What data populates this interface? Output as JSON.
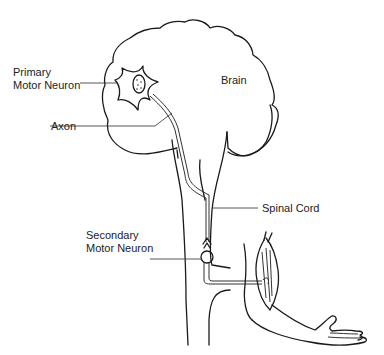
{
  "diagram": {
    "type": "anatomical-line-drawing",
    "labels": {
      "primary_motor_neuron_line1": "Primary",
      "primary_motor_neuron_line2": "Motor Neuron",
      "axon": "Axon",
      "brain": "Brain",
      "spinal_cord": "Spinal Cord",
      "secondary_motor_neuron_line1": "Secondary",
      "secondary_motor_neuron_line2": "Motor Neuron"
    },
    "colors": {
      "background": "#ffffff",
      "stroke": "#1a1a1a",
      "text": "#222222"
    }
  }
}
